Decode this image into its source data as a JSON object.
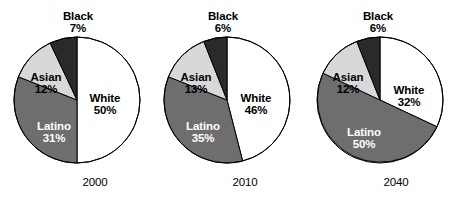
{
  "chart_data": {
    "type": "pie",
    "title": "",
    "subtitle": "",
    "xlabel": "",
    "ylabel": "",
    "legend_position": "none",
    "grid": false,
    "note": "Three pie charts showing racial/ethnic population share by year. Slices ordered clockwise from 12 o'clock: White, Latino, Asian, Black.",
    "categories": [
      "White",
      "Latino",
      "Asian",
      "Black"
    ],
    "colors": {
      "White": "#ffffff",
      "Latino": "#6e6e6e",
      "Asian": "#d8d8d8",
      "Black": "#2a2a2a",
      "outline": "#000000",
      "background": "#ffffff"
    },
    "charts": [
      {
        "year": "2000",
        "slices": [
          {
            "label": "White",
            "value": 50,
            "value_text": "50%"
          },
          {
            "label": "Latino",
            "value": 31,
            "value_text": "31%"
          },
          {
            "label": "Asian",
            "value": 12,
            "value_text": "12%"
          },
          {
            "label": "Black",
            "value": 7,
            "value_text": "7%"
          }
        ]
      },
      {
        "year": "2010",
        "slices": [
          {
            "label": "White",
            "value": 46,
            "value_text": "46%"
          },
          {
            "label": "Latino",
            "value": 35,
            "value_text": "35%"
          },
          {
            "label": "Asian",
            "value": 13,
            "value_text": "13%"
          },
          {
            "label": "Black",
            "value": 6,
            "value_text": "6%"
          }
        ]
      },
      {
        "year": "2040",
        "slices": [
          {
            "label": "White",
            "value": 32,
            "value_text": "32%"
          },
          {
            "label": "Latino",
            "value": 50,
            "value_text": "50%"
          },
          {
            "label": "Asian",
            "value": 12,
            "value_text": "12%"
          },
          {
            "label": "Black",
            "value": 6,
            "value_text": "6%"
          }
        ]
      }
    ]
  },
  "layout": {
    "pies": [
      {
        "cx": 77,
        "cy": 100,
        "r": 63,
        "label_positions": {
          "White": {
            "x": 105,
            "y": 92,
            "style": "on-light"
          },
          "Latino": {
            "x": 54,
            "y": 120,
            "style": "on-dark"
          },
          "Asian": {
            "x": 46,
            "y": 71,
            "style": "on-light"
          },
          "Black": {
            "x": 78,
            "y": 10,
            "style": "external"
          }
        },
        "year_position": {
          "x": 95,
          "y": 176
        }
      },
      {
        "cx": 227,
        "cy": 100,
        "r": 63,
        "label_positions": {
          "White": {
            "x": 256,
            "y": 92,
            "style": "on-light"
          },
          "Latino": {
            "x": 203,
            "y": 120,
            "style": "on-dark"
          },
          "Asian": {
            "x": 196,
            "y": 71,
            "style": "on-light"
          },
          "Black": {
            "x": 223,
            "y": 10,
            "style": "external"
          }
        },
        "year_position": {
          "x": 245,
          "y": 176
        }
      },
      {
        "cx": 380,
        "cy": 100,
        "r": 63,
        "label_positions": {
          "White": {
            "x": 409,
            "y": 84,
            "style": "on-light"
          },
          "Latino": {
            "x": 364,
            "y": 126,
            "style": "on-dark"
          },
          "Asian": {
            "x": 348,
            "y": 71,
            "style": "on-light"
          },
          "Black": {
            "x": 378,
            "y": 10,
            "style": "external"
          }
        },
        "year_position": {
          "x": 396,
          "y": 176
        }
      }
    ]
  }
}
